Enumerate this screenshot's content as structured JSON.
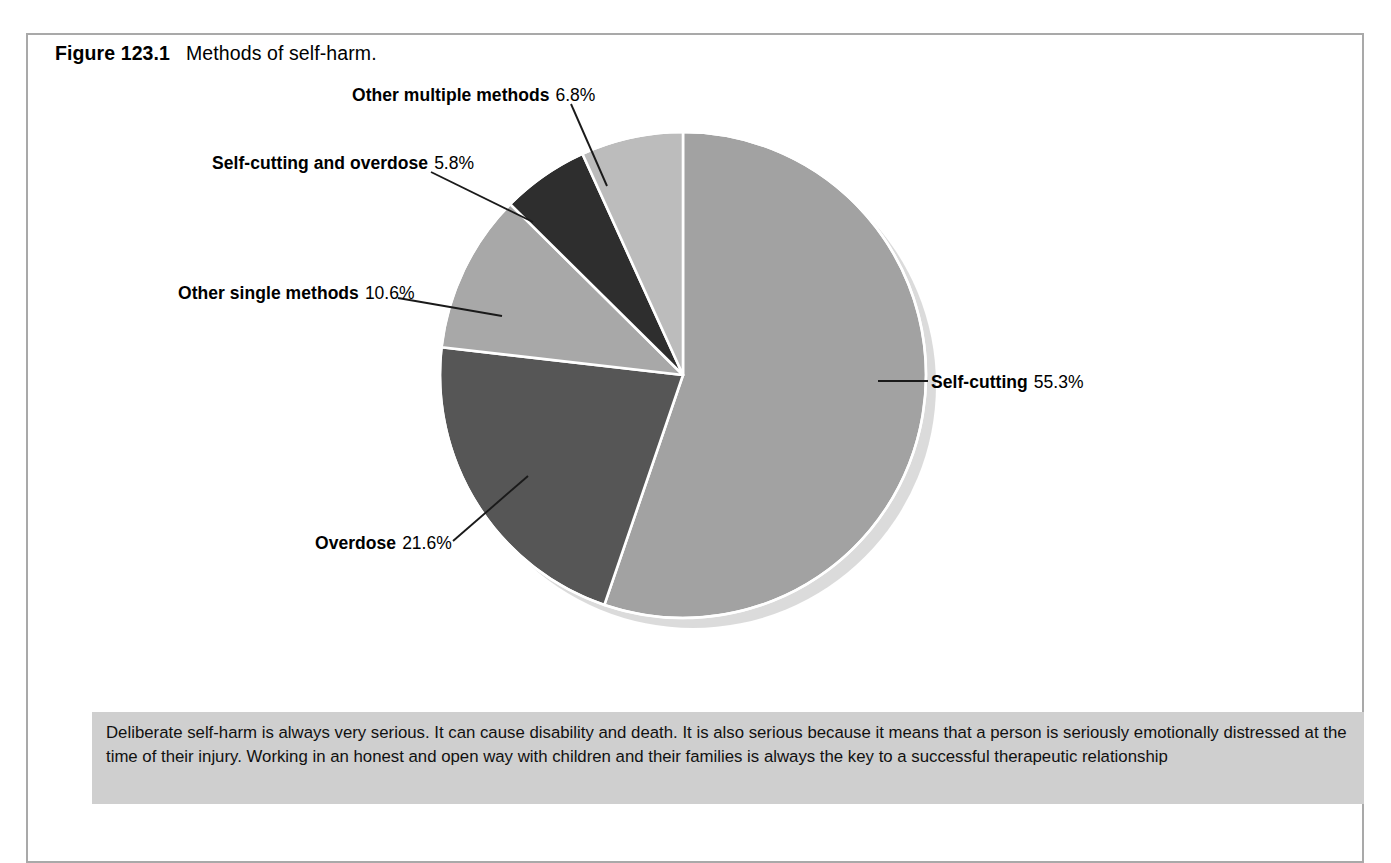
{
  "figure": {
    "number_label": "Figure 123.1",
    "title": "Methods of self-harm."
  },
  "chart_data": {
    "type": "pie",
    "title": "Methods of self-harm.",
    "legend_position": "callout-labels",
    "grid": false,
    "units": "percent",
    "total": 100.1,
    "start_angle_deg": 0,
    "direction": "clockwise",
    "categories": [
      "Self-cutting",
      "Overdose",
      "Other single methods",
      "Self-cutting and overdose",
      "Other multiple methods"
    ],
    "values": [
      55.3,
      21.6,
      10.6,
      5.8,
      6.8
    ],
    "value_labels": [
      "55.3%",
      "21.6%",
      "10.6%",
      "5.8%",
      "6.8%"
    ],
    "colors": [
      "#a2a2a2",
      "#565656",
      "#a8a8a8",
      "#2e2e2e",
      "#bcbcbc"
    ],
    "slices": [
      {
        "name": "Self-cutting",
        "value": 55.3,
        "label": "55.3%",
        "color": "#a2a2a2"
      },
      {
        "name": "Overdose",
        "value": 21.6,
        "label": "21.6%",
        "color": "#565656"
      },
      {
        "name": "Other single methods",
        "value": 10.6,
        "label": "10.6%",
        "color": "#a8a8a8"
      },
      {
        "name": "Self-cutting and overdose",
        "value": 5.8,
        "label": "5.8%",
        "color": "#2e2e2e"
      },
      {
        "name": "Other multiple methods",
        "value": 6.8,
        "label": "6.8%",
        "color": "#bcbcbc"
      }
    ]
  },
  "labels": {
    "other_multiple": {
      "name": "Other multiple methods",
      "pct": "6.8%"
    },
    "cut_and_od": {
      "name": "Self-cutting and overdose",
      "pct": "5.8%"
    },
    "other_single": {
      "name": "Other single methods",
      "pct": "10.6%"
    },
    "self_cutting": {
      "name": "Self-cutting",
      "pct": "55.3%"
    },
    "overdose": {
      "name": "Overdose",
      "pct": "21.6%"
    }
  },
  "note": {
    "text": "Deliberate self-harm is always very serious. It can cause disability and death. It is also serious because it means that a person is seriously emotionally distressed at the time of their injury. Working in an honest and open way with children and their families is always the key to a successful therapeutic relationship",
    "background_color": "#cfcfcf"
  },
  "style": {
    "frame_color": "#a9a9a9",
    "slice_separator_color": "#ffffff",
    "leader_line_color": "#1a1a1a",
    "page_background": "#ffffff"
  }
}
